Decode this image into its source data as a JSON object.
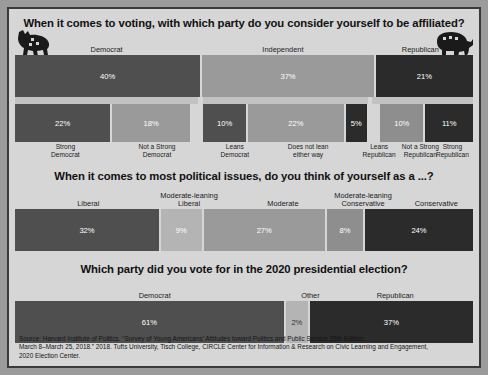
{
  "poster": {
    "background_color": "#d6d6d6",
    "border_color": "#3a3a3a"
  },
  "colors": {
    "democrat": "#4f4f4f",
    "independent": "#9a9a9a",
    "republican": "#2b2b2b",
    "light": "#b4b4b4",
    "mid": "#8e8e8e"
  },
  "icons": {
    "left": "democratic-donkey-icon",
    "right": "republican-elephant-icon"
  },
  "sections": [
    {
      "id": "party-affiliation",
      "title": "When it comes to voting, with which party do you consider yourself to be affiliated?",
      "labels": [
        "Democrat",
        "Independent",
        "Republican"
      ],
      "values": [
        "40%",
        "37%",
        "21%"
      ],
      "sub_labels": [
        "Strong\nDemocrat",
        "Not a Strong\nDemocrat",
        "Leans\nDemocrat",
        "Does not lean\neither way",
        "Leans\nRepublican",
        "Not a Strong\nRepublican",
        "Strong\nRepublican"
      ],
      "sub_values": [
        "22%",
        "18%",
        "10%",
        "22%",
        "5%",
        "10%",
        "11%"
      ]
    },
    {
      "id": "political-ideology",
      "title": "When it comes to most political issues, do you think of yourself as a ...?",
      "labels": [
        "Liberal",
        "Moderate-leaning\nLiberal",
        "Moderate",
        "Moderate-leaning\nConservative",
        "Conservative"
      ],
      "values": [
        "32%",
        "9%",
        "27%",
        "8%",
        "24%"
      ]
    },
    {
      "id": "presidential-vote-2020",
      "title": "Which party did you vote for in the 2020 presidential election?",
      "labels": [
        "Democrat",
        "Other",
        "Republican"
      ],
      "values": [
        "61%",
        "2%",
        "37%"
      ]
    }
  ],
  "source": {
    "line1": "Source: Harvard Institute of Politics. “Survey of Young Americans’ Attitudes toward Politics and Public Service 35th Edition:",
    "line2": "March 8–March 25, 2018.” 2018. Tufts University, Tisch College, CIRCLE Center for Information & Research on Civic Learning and Engagement,",
    "line3": "2020 Election Center."
  },
  "chart_data": [
    {
      "type": "bar",
      "orientation": "stacked-horizontal",
      "title": "When it comes to voting, with which party do you consider yourself to be affiliated?",
      "categories": [
        "Democrat",
        "Independent",
        "Republican"
      ],
      "values": [
        40,
        37,
        21
      ],
      "unit": "percent",
      "xlabel": "",
      "ylabel": "",
      "xlim": [
        0,
        98
      ],
      "grid": false,
      "legend": "none",
      "breakdown": {
        "categories": [
          "Strong Democrat",
          "Not a Strong Democrat",
          "Leans Democrat",
          "Does not lean either way",
          "Leans Republican",
          "Not a Strong Republican",
          "Strong Republican"
        ],
        "values": [
          22,
          18,
          10,
          22,
          5,
          10,
          11
        ]
      }
    },
    {
      "type": "bar",
      "orientation": "stacked-horizontal",
      "title": "When it comes to most political issues, do you think of yourself as a ...?",
      "categories": [
        "Liberal",
        "Moderate-leaning Liberal",
        "Moderate",
        "Moderate-leaning Conservative",
        "Conservative"
      ],
      "values": [
        32,
        9,
        27,
        8,
        24
      ],
      "unit": "percent",
      "xlabel": "",
      "ylabel": "",
      "xlim": [
        0,
        100
      ],
      "grid": false,
      "legend": "none"
    },
    {
      "type": "bar",
      "orientation": "stacked-horizontal",
      "title": "Which party did you vote for in the 2020 presidential election?",
      "categories": [
        "Democrat",
        "Other",
        "Republican"
      ],
      "values": [
        61,
        2,
        37
      ],
      "unit": "percent",
      "xlabel": "",
      "ylabel": "",
      "xlim": [
        0,
        100
      ],
      "grid": false,
      "legend": "none"
    }
  ]
}
